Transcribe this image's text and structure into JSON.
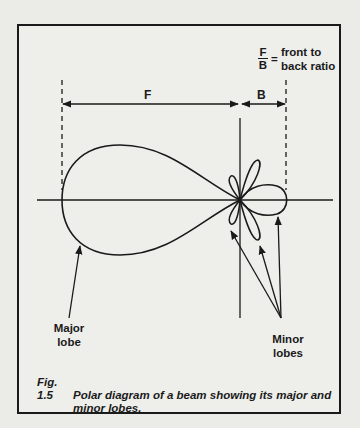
{
  "legend": {
    "fraction_numerator": "F",
    "fraction_denominator": "B",
    "equals": "=",
    "line1": "front to",
    "line2": "back ratio"
  },
  "dimensions": {
    "front_label": "F",
    "back_label": "B"
  },
  "annotations": {
    "major_line1": "Major",
    "major_line2": "lobe",
    "minor_line1": "Minor",
    "minor_line2": "lobes"
  },
  "caption": {
    "number": "Fig. 1.5",
    "line1": "Polar diagram of a beam showing its major and",
    "line2": "minor lobes."
  },
  "colors": {
    "ink": "#1a1a1a",
    "paper": "#ebebe8"
  }
}
